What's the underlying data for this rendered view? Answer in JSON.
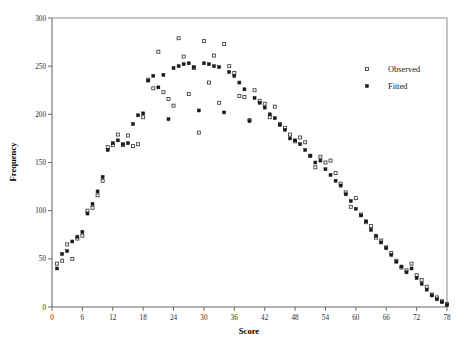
{
  "chart_data": {
    "type": "scatter",
    "title": "",
    "xlabel": "Score",
    "ylabel": "Frequency",
    "xlim": [
      0,
      78
    ],
    "ylim": [
      0,
      300
    ],
    "xticks": [
      0,
      6,
      12,
      18,
      24,
      30,
      36,
      42,
      48,
      54,
      60,
      66,
      72,
      78
    ],
    "yticks": [
      0,
      50,
      100,
      150,
      200,
      250,
      300
    ],
    "xtick_labels": [
      "0",
      "6",
      "12",
      "18",
      "24",
      "30",
      "36",
      "42",
      "48",
      "54",
      "60",
      "66",
      "72",
      "78"
    ],
    "ytick_labels": [
      "0",
      "50",
      "100",
      "150",
      "200",
      "250",
      "300"
    ],
    "grid": false,
    "legend_position": "right",
    "legend": [
      {
        "name": "Observed",
        "marker": "open-square",
        "color": "#3a3a3a"
      },
      {
        "name": "Fitted",
        "marker": "filled-square",
        "color": "#1a1a1a"
      }
    ],
    "series": [
      {
        "name": "Observed",
        "marker": "open-square",
        "points": [
          [
            1,
            45
          ],
          [
            2,
            48
          ],
          [
            3,
            65
          ],
          [
            4,
            50
          ],
          [
            5,
            71
          ],
          [
            6,
            74
          ],
          [
            7,
            100
          ],
          [
            8,
            103
          ],
          [
            9,
            116
          ],
          [
            10,
            131
          ],
          [
            11,
            166
          ],
          [
            12,
            168
          ],
          [
            13,
            179
          ],
          [
            14,
            168
          ],
          [
            15,
            178
          ],
          [
            16,
            167
          ],
          [
            17,
            169
          ],
          [
            18,
            197
          ],
          [
            19,
            236
          ],
          [
            20,
            227
          ],
          [
            21,
            265
          ],
          [
            22,
            223
          ],
          [
            23,
            216
          ],
          [
            24,
            209
          ],
          [
            25,
            279
          ],
          [
            26,
            260
          ],
          [
            27,
            221
          ],
          [
            28,
            248
          ],
          [
            29,
            181
          ],
          [
            30,
            276
          ],
          [
            31,
            233
          ],
          [
            32,
            261
          ],
          [
            33,
            212
          ],
          [
            34,
            273
          ],
          [
            35,
            250
          ],
          [
            36,
            243
          ],
          [
            37,
            219
          ],
          [
            38,
            218
          ],
          [
            39,
            194
          ],
          [
            40,
            225
          ],
          [
            41,
            214
          ],
          [
            42,
            211
          ],
          [
            43,
            197
          ],
          [
            44,
            208
          ],
          [
            45,
            190
          ],
          [
            46,
            186
          ],
          [
            47,
            179
          ],
          [
            48,
            172
          ],
          [
            49,
            176
          ],
          [
            50,
            171
          ],
          [
            51,
            157
          ],
          [
            52,
            145
          ],
          [
            53,
            156
          ],
          [
            54,
            150
          ],
          [
            55,
            152
          ],
          [
            56,
            139
          ],
          [
            57,
            128
          ],
          [
            58,
            119
          ],
          [
            59,
            104
          ],
          [
            60,
            113
          ],
          [
            61,
            96
          ],
          [
            62,
            88
          ],
          [
            63,
            84
          ],
          [
            64,
            72
          ],
          [
            65,
            69
          ],
          [
            66,
            62
          ],
          [
            67,
            56
          ],
          [
            68,
            48
          ],
          [
            69,
            41
          ],
          [
            70,
            38
          ],
          [
            71,
            45
          ],
          [
            72,
            33
          ],
          [
            73,
            28
          ],
          [
            74,
            21
          ],
          [
            75,
            13
          ],
          [
            76,
            10
          ],
          [
            77,
            6
          ],
          [
            78,
            3
          ]
        ]
      },
      {
        "name": "Fitted",
        "marker": "filled-square",
        "points": [
          [
            1,
            40
          ],
          [
            2,
            55
          ],
          [
            3,
            58
          ],
          [
            4,
            68
          ],
          [
            5,
            73
          ],
          [
            6,
            78
          ],
          [
            7,
            97
          ],
          [
            8,
            107
          ],
          [
            9,
            120
          ],
          [
            10,
            135
          ],
          [
            11,
            163
          ],
          [
            12,
            170
          ],
          [
            13,
            173
          ],
          [
            14,
            169
          ],
          [
            15,
            170
          ],
          [
            16,
            190
          ],
          [
            17,
            199
          ],
          [
            18,
            201
          ],
          [
            19,
            235
          ],
          [
            20,
            240
          ],
          [
            21,
            228
          ],
          [
            22,
            241
          ],
          [
            23,
            195
          ],
          [
            24,
            248
          ],
          [
            25,
            250
          ],
          [
            26,
            252
          ],
          [
            27,
            253
          ],
          [
            28,
            249
          ],
          [
            29,
            204
          ],
          [
            30,
            253
          ],
          [
            31,
            252
          ],
          [
            32,
            250
          ],
          [
            33,
            249
          ],
          [
            34,
            202
          ],
          [
            35,
            244
          ],
          [
            36,
            240
          ],
          [
            37,
            233
          ],
          [
            38,
            226
          ],
          [
            39,
            193
          ],
          [
            40,
            217
          ],
          [
            41,
            212
          ],
          [
            42,
            207
          ],
          [
            43,
            200
          ],
          [
            44,
            196
          ],
          [
            45,
            189
          ],
          [
            46,
            184
          ],
          [
            47,
            175
          ],
          [
            48,
            173
          ],
          [
            49,
            169
          ],
          [
            50,
            163
          ],
          [
            51,
            157
          ],
          [
            52,
            150
          ],
          [
            53,
            152
          ],
          [
            54,
            143
          ],
          [
            55,
            137
          ],
          [
            56,
            131
          ],
          [
            57,
            126
          ],
          [
            58,
            117
          ],
          [
            59,
            110
          ],
          [
            60,
            102
          ],
          [
            61,
            95
          ],
          [
            62,
            89
          ],
          [
            63,
            80
          ],
          [
            64,
            74
          ],
          [
            65,
            67
          ],
          [
            66,
            61
          ],
          [
            67,
            54
          ],
          [
            68,
            47
          ],
          [
            69,
            42
          ],
          [
            70,
            36
          ],
          [
            71,
            40
          ],
          [
            72,
            30
          ],
          [
            73,
            24
          ],
          [
            74,
            18
          ],
          [
            75,
            12
          ],
          [
            76,
            8
          ],
          [
            77,
            5
          ],
          [
            78,
            2
          ]
        ]
      }
    ]
  },
  "axes": {
    "x_title": "Score",
    "y_title": "Frequency"
  }
}
